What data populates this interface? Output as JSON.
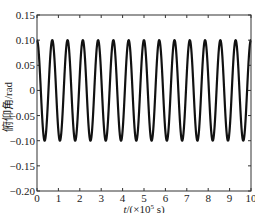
{
  "chart_data": {
    "type": "line",
    "title": "",
    "xlabel": "t/(×10⁵ s)",
    "xlabel_parts": {
      "italic": "t",
      "rest_prefix": "/(×10",
      "sup": "5",
      "rest_suffix": " s)"
    },
    "ylabel": "俯仰角/rad",
    "xlim": [
      0,
      10
    ],
    "ylim": [
      -0.2,
      0.15
    ],
    "x_ticks": [
      0,
      1,
      2,
      3,
      4,
      5,
      6,
      7,
      8,
      9,
      10
    ],
    "x_tick_labels": [
      "0",
      "1",
      "2",
      "3",
      "4",
      "5",
      "6",
      "7",
      "8",
      "9",
      "10"
    ],
    "y_ticks": [
      0.15,
      0.1,
      0.05,
      0,
      -0.05,
      -0.1,
      -0.15,
      -0.2
    ],
    "y_tick_labels": [
      "0.15",
      "0.10",
      "0.05",
      "0",
      "-0.05",
      "-0.10",
      "-0.15",
      "-0.20"
    ],
    "grid": false,
    "legend": null,
    "series": [
      {
        "name": "pitch angle",
        "function": "0.1*cos(2*pi*t/0.714)",
        "amplitude": 0.1,
        "period": 0.714,
        "peaks_count": 15,
        "color": "#111111",
        "x": [
          0,
          0.357,
          0.714,
          1.071,
          1.428,
          1.785,
          2.142,
          2.499,
          2.856,
          3.213,
          3.57,
          3.927,
          4.284,
          4.641,
          4.998,
          5.355,
          5.712,
          6.069,
          6.426,
          6.783,
          7.14,
          7.497,
          7.854,
          8.211,
          8.568,
          8.925,
          9.282,
          9.639,
          9.996,
          10
        ],
        "values": [
          0.1,
          -0.1,
          0.1,
          -0.1,
          0.1,
          -0.1,
          0.1,
          -0.1,
          0.1,
          -0.1,
          0.1,
          -0.1,
          0.1,
          -0.1,
          0.1,
          -0.1,
          0.1,
          -0.1,
          0.1,
          -0.1,
          0.1,
          -0.1,
          0.1,
          -0.1,
          0.1,
          -0.1,
          0.1,
          -0.1,
          0.1,
          0.1
        ]
      }
    ]
  },
  "plot_box": {
    "left": 37,
    "top": 15,
    "right": 251,
    "bottom": 191
  }
}
